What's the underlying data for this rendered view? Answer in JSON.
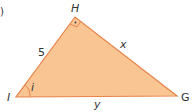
{
  "diagram": {
    "type": "right-triangle",
    "fill_color": "#f9c592",
    "stroke_color": "#e8844a",
    "vertices": {
      "H": {
        "label": "H",
        "x": 75,
        "y": 17,
        "right_angle": true
      },
      "I": {
        "label": "I",
        "x": 16,
        "y": 97
      },
      "G": {
        "label": "G",
        "x": 177,
        "y": 96
      }
    },
    "sides": {
      "HI": {
        "label": "5"
      },
      "HG": {
        "label": "x"
      },
      "IG": {
        "label": "y"
      }
    },
    "angle_I": {
      "label": "i"
    },
    "part_marker": ")"
  }
}
